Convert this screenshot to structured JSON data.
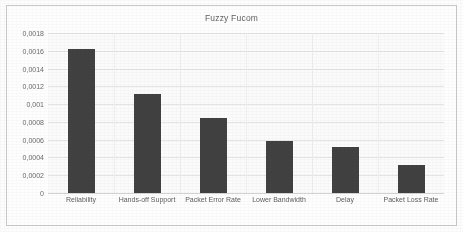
{
  "chart_data": {
    "type": "bar",
    "title": "Fuzzy Fucom",
    "xlabel": "",
    "ylabel": "",
    "categories": [
      "Reliability",
      "Hands-off Support",
      "Packet Error Rate",
      "Lower Bandwidth",
      "Delay",
      "Packet Loss Rate"
    ],
    "values": [
      0.00162,
      0.00111,
      0.00084,
      0.00058,
      0.00052,
      0.00031
    ],
    "ylim": [
      0,
      0.0018
    ],
    "ytick_values": [
      0,
      0.0002,
      0.0004,
      0.0006,
      0.0008,
      0.001,
      0.0012,
      0.0014,
      0.0016,
      0.0018
    ],
    "ytick_labels": [
      "0",
      "0,0002",
      "0,0004",
      "0,0006",
      "0,0008",
      "0,001",
      "0,0012",
      "0,0014",
      "0,0016",
      "0,0018"
    ],
    "decimal_separator": ",",
    "grid": true,
    "grid_axis": "y",
    "legend": false,
    "legend_position": "none",
    "series": [
      {
        "name": "Fuzzy Fucom",
        "color": "#414141",
        "values": [
          0.00162,
          0.00111,
          0.00084,
          0.00058,
          0.00052,
          0.00031
        ]
      }
    ],
    "bar_color": "#414141",
    "background_color": "#fbfbfb",
    "gridline_color": "#e4e4e4",
    "border_color": "#c9c9c9",
    "title_color": "#5f5f5f",
    "tick_label_color": "#6a6a6a"
  }
}
